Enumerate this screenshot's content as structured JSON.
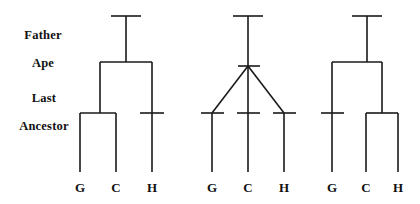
{
  "figure": {
    "background_color": "#ffffff",
    "line_color": "#1a1a1a",
    "text_color": "#111111"
  },
  "levels": [
    {
      "id": "father-ape",
      "label": "Father\nApe",
      "line1": "Father",
      "line2": "Ape"
    },
    {
      "id": "last-ancestor",
      "label": "Last\nAncestor",
      "line1": "Last",
      "line2": "Ancestor"
    }
  ],
  "taxa_legend": {
    "G": "Gorilla",
    "C": "Chimpanzee",
    "H": "Human"
  },
  "trees": [
    {
      "id": "tree-1",
      "topology": "((G,C),H)",
      "taxa": [
        {
          "code": "G",
          "x": 80
        },
        {
          "code": "C",
          "x": 116
        },
        {
          "code": "H",
          "x": 152
        }
      ]
    },
    {
      "id": "tree-2",
      "topology": "(G,C,H)",
      "taxa": [
        {
          "code": "G",
          "x": 212
        },
        {
          "code": "C",
          "x": 248
        },
        {
          "code": "H",
          "x": 284
        }
      ]
    },
    {
      "id": "tree-3",
      "topology": "(G,(C,H))",
      "taxa": [
        {
          "code": "G",
          "x": 332
        },
        {
          "code": "C",
          "x": 366
        },
        {
          "code": "H",
          "x": 398
        }
      ]
    }
  ]
}
